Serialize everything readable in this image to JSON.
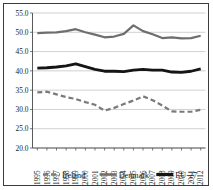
{
  "chart_data": {
    "type": "line",
    "title": "",
    "xlabel": "",
    "ylabel": "",
    "ylim": [
      20.0,
      55.0
    ],
    "ytick_step": 5.0,
    "yticks": [
      "20.0",
      "25.0",
      "30.0",
      "35.0",
      "40.0",
      "45.0",
      "50.0",
      "55.0"
    ],
    "grid": true,
    "grid_axis": "y",
    "legend_position": "bottom",
    "categories": [
      "1995",
      "1996",
      "1997",
      "1998",
      "1999",
      "2000",
      "2001",
      "2002",
      "2003",
      "2004",
      "2005",
      "2006",
      "2007",
      "2008",
      "2009",
      "2010",
      "2011",
      "2012"
    ],
    "series": [
      {
        "name": "Ireland",
        "color": "#7a7a7a",
        "style": "dashed",
        "width": 2.2,
        "values": [
          34.4,
          34.6,
          33.9,
          33.2,
          32.7,
          31.9,
          31.2,
          29.7,
          30.4,
          31.4,
          32.3,
          33.4,
          32.4,
          31.0,
          29.5,
          29.4,
          29.4,
          29.9
        ]
      },
      {
        "name": "Denmark",
        "color": "#6e6e6e",
        "style": "solid",
        "width": 2.2,
        "values": [
          49.8,
          49.9,
          50.0,
          50.3,
          50.8,
          50.0,
          49.4,
          48.7,
          48.9,
          49.6,
          51.8,
          50.3,
          49.5,
          48.5,
          48.7,
          48.4,
          48.5,
          49.1
        ]
      },
      {
        "name": "EU-27",
        "color": "#151515",
        "style": "solid",
        "width": 2.8,
        "values": [
          40.7,
          40.8,
          41.0,
          41.3,
          41.8,
          41.1,
          40.4,
          39.9,
          39.9,
          39.8,
          40.2,
          40.4,
          40.2,
          40.2,
          39.7,
          39.6,
          39.9,
          40.5
        ]
      }
    ]
  }
}
